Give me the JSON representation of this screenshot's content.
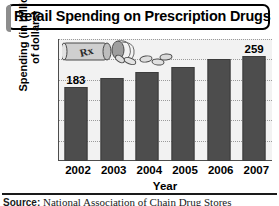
{
  "chart_data": {
    "type": "bar",
    "title": "Retail Spending on Prescription Drugs",
    "xlabel": "Year",
    "ylabel": "Spending (in billions of dollars)",
    "ylabel_line1": "Spending (in billions",
    "ylabel_line2": "of dollars)",
    "categories": [
      "2002",
      "2003",
      "2004",
      "2005",
      "2006",
      "2007"
    ],
    "values": [
      183,
      205,
      220,
      232,
      250,
      259
    ],
    "point_labels": [
      "183",
      "",
      "",
      "",
      "",
      "259"
    ],
    "yticks": [
      300,
      250,
      200,
      150,
      100,
      50,
      0
    ],
    "ylim": [
      0,
      300
    ],
    "grid": true,
    "legend": null,
    "bar_color": "#4d4d4d",
    "plot_background": "#f2f2f2",
    "annotation": "Rx pill bottle with spilled pills"
  },
  "source": {
    "prefix": "Source:",
    "text": "National Association of Chain Drug Stores"
  }
}
